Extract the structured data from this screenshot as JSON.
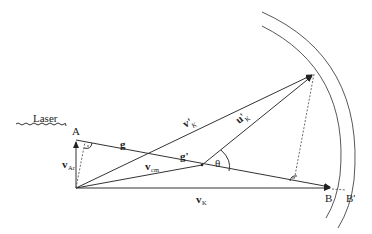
{
  "diagram": {
    "type": "vector kinematics diagram (Newton sphere)",
    "labels": {
      "laser": "Laser",
      "point_a": "A",
      "point_b": "B",
      "point_b_prime": "B'",
      "g": "g",
      "g_prime": "g'",
      "v_ar": "v",
      "v_ar_sub": "Ar",
      "v_cm": "v",
      "v_cm_sub": "cm",
      "v_k": "v",
      "v_k_sub": "K",
      "v_k_prime": "v'",
      "v_k_prime_sub": "K",
      "u_k_prime": "u'",
      "u_k_prime_sub": "K",
      "theta": "θ"
    },
    "colors": {
      "line": "#333333",
      "background": "#ffffff"
    }
  }
}
